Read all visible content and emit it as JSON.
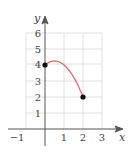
{
  "chart_data": {
    "type": "line",
    "title": "",
    "xlabel": "x",
    "ylabel": "y",
    "xlim": [
      -1.5,
      3.5
    ],
    "ylim": [
      0,
      6.5
    ],
    "grid": true,
    "x_ticks": [
      "-1",
      "1",
      "2",
      "3"
    ],
    "y_ticks": [
      "1",
      "2",
      "3",
      "4",
      "5",
      "6"
    ],
    "series": [
      {
        "name": "f(x)",
        "color": "#e06b6b",
        "domain": [
          0,
          2
        ],
        "x": [
          0,
          0.25,
          0.5,
          0.75,
          1.0,
          1.25,
          1.5,
          1.75,
          2.0
        ],
        "y": [
          4.0,
          4.19,
          4.25,
          4.19,
          4.0,
          3.69,
          3.25,
          2.69,
          2.0
        ]
      }
    ],
    "endpoints": [
      {
        "x": 0,
        "y": 4,
        "filled": true
      },
      {
        "x": 2,
        "y": 2,
        "filled": true
      }
    ]
  },
  "labels": {
    "x_axis": "x",
    "y_axis": "y",
    "xt_neg1": "−1",
    "xt_1": "1",
    "xt_2": "2",
    "xt_3": "3",
    "yt_1": "1",
    "yt_2": "2",
    "yt_3": "3",
    "yt_4": "4",
    "yt_5": "5",
    "yt_6": "6"
  }
}
